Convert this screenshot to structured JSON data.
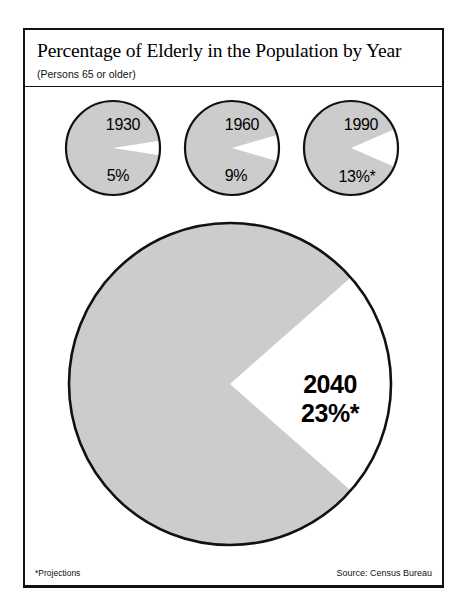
{
  "figure": {
    "title": "Percentage of Elderly in the Population by Year",
    "subtitle": "(Persons 65 or older)",
    "footnote": "*Projections",
    "source": "Source: Census Bureau",
    "colors": {
      "slice_fill": "#cccccc",
      "slice_highlight": "#ffffff",
      "outline": "#111111",
      "background": "#ffffff",
      "text": "#000000"
    }
  },
  "chart_data": {
    "type": "pie",
    "title": "Percentage of Elderly in the Population by Year",
    "subtitle": "(Persons 65 or older)",
    "xlabel": "",
    "ylabel": "",
    "grid": false,
    "legend": "none",
    "note": "Each circle is a whole population; the white wedge is the share aged 65 or older.",
    "series": [
      {
        "name": "65 or older",
        "values": [
          5,
          9,
          13,
          23
        ]
      },
      {
        "name": "Under 65",
        "values": [
          95,
          91,
          87,
          77
        ]
      }
    ],
    "categories": [
      "1930",
      "1960",
      "1990",
      "2040"
    ],
    "values": [
      5,
      9,
      13,
      23
    ],
    "units": "percent",
    "pies": [
      {
        "year": "1930",
        "percent": 5,
        "percent_label": "5%",
        "projection": false,
        "size": "small",
        "cx": 113,
        "cy": 148,
        "r": 47,
        "year_label_x": 123,
        "year_label_y": 125,
        "pct_label_x": 118,
        "pct_label_y": 176
      },
      {
        "year": "1960",
        "percent": 9,
        "percent_label": "9%",
        "projection": false,
        "size": "small",
        "cx": 232,
        "cy": 148,
        "r": 47,
        "year_label_x": 242,
        "year_label_y": 125,
        "pct_label_x": 236,
        "pct_label_y": 176
      },
      {
        "year": "1990",
        "percent": 13,
        "percent_label": "13%*",
        "projection": true,
        "size": "small",
        "cx": 351,
        "cy": 148,
        "r": 47,
        "year_label_x": 361,
        "year_label_y": 125,
        "pct_label_x": 357,
        "pct_label_y": 177
      },
      {
        "year": "2040",
        "percent": 23,
        "percent_label": "23%*",
        "projection": true,
        "size": "large",
        "cx": 230,
        "cy": 384,
        "r": 161,
        "year_label_x": 330,
        "year_label_y": 384,
        "pct_label_x": 330,
        "pct_label_y": 413
      }
    ]
  }
}
